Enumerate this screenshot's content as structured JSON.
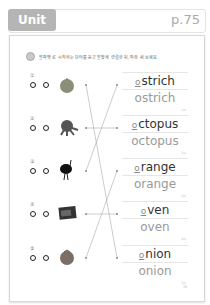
{
  "header": {
    "unit": "Unit 15",
    "page": "p.75"
  },
  "instruction": {
    "icon": "audio-icon",
    "text": "알파벳 로 시작하는 단어를 듣고 알맞게 연결한 뒤, 따라 써 보세요."
  },
  "rows": [
    {
      "num": "①",
      "picture": "onion-picture"
    },
    {
      "num": "②",
      "picture": "octopus-picture"
    },
    {
      "num": "③",
      "picture": "ostrich-picture"
    },
    {
      "num": "④",
      "picture": "oven-picture"
    },
    {
      "num": "⑤",
      "picture": "orange-picture"
    }
  ],
  "words": [
    {
      "blank": "o",
      "rest": "strich",
      "full": "ostrich",
      "tag": "1/4"
    },
    {
      "blank": "o",
      "rest": "ctopus",
      "full": "octopus",
      "tag": "2/4"
    },
    {
      "blank": "o",
      "rest": "range",
      "full": "orange",
      "tag": "3/4"
    },
    {
      "blank": "o",
      "rest": "ven",
      "full": "oven",
      "tag": "4/4"
    },
    {
      "blank": "o",
      "rest": "nion",
      "full": "onion",
      "tag": "5/4"
    }
  ],
  "connections": [
    [
      1,
      5
    ],
    [
      2,
      2
    ],
    [
      3,
      1
    ],
    [
      4,
      4
    ],
    [
      5,
      3
    ]
  ],
  "footer": {
    "page": "75"
  },
  "colors": {
    "badge": "#b5b5b5",
    "page_num": "#a9a9a9"
  }
}
